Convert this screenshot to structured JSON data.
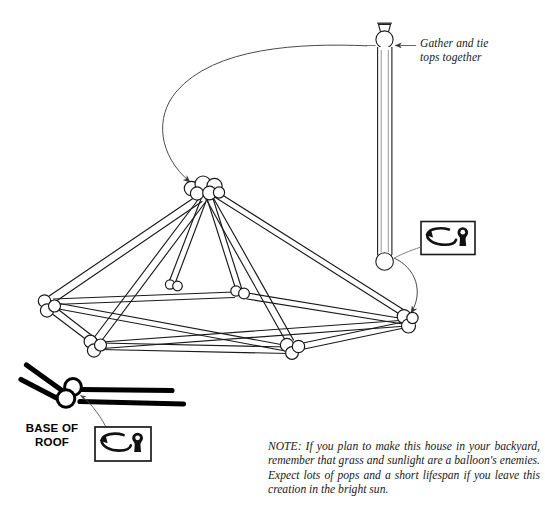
{
  "page": {
    "background_color": "#ffffff",
    "ink_color": "#111111",
    "width": 545,
    "height": 509
  },
  "callouts": {
    "gather": {
      "line1": "Gather and tie",
      "line2": "tops together"
    },
    "base_of_roof": {
      "line1": "BASE OF",
      "line2": "ROOF"
    }
  },
  "note": {
    "text": "NOTE: If you plan to make this house in your backyard, remember that grass and sunlight are a balloon's enemies. Expect lots of pops and a short lifespan if you leave this creation in the bright sun."
  },
  "icons": {
    "twist_symbol_name": "twist-knot-icon",
    "balloon_knot_name": "balloon-knot-icon",
    "arrow_name": "curved-arrow-icon"
  },
  "structure": {
    "apex_knot_count": 5,
    "legs": 6,
    "base_joints": 5,
    "description": "Balloon dome frame: apex cluster with legs radiating to a base ring"
  },
  "balloon": {
    "description": "Single inflated long balloon, knot at top, rounded end at bottom"
  }
}
